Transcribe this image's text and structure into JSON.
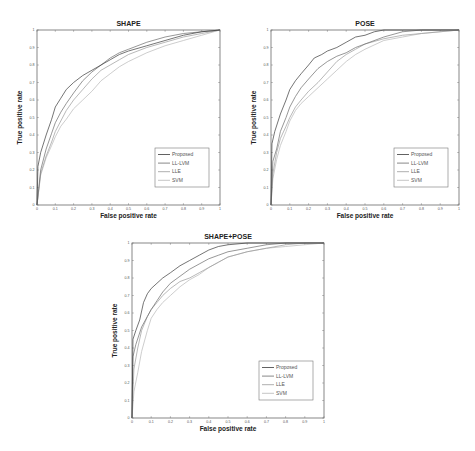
{
  "chart_data": [
    {
      "type": "line",
      "title": "SHAPE",
      "xlabel": "False positive rate",
      "ylabel": "True positive rate",
      "xlim": [
        0,
        1
      ],
      "ylim": [
        0,
        1
      ],
      "xticks": [
        "0",
        "0.1",
        "0.2",
        "0.3",
        "0.4",
        "0.5",
        "0.6",
        "0.7",
        "0.8",
        "0.9",
        "1"
      ],
      "yticks": [
        "0",
        "0.1",
        "0.2",
        "0.3",
        "0.4",
        "0.5",
        "0.6",
        "0.7",
        "0.8",
        "0.9",
        "1"
      ],
      "grid": false,
      "legend_position": "lower right",
      "box": {
        "x": 37,
        "y": 30,
        "w": 183,
        "h": 175
      },
      "series": [
        {
          "name": "Proposed",
          "color": "#3a3a3a",
          "x": [
            0,
            0.005,
            0.02,
            0.05,
            0.08,
            0.1,
            0.13,
            0.16,
            0.2,
            0.25,
            0.3,
            0.35,
            0.4,
            0.45,
            0.5,
            0.6,
            0.7,
            0.8,
            0.9,
            1
          ],
          "y": [
            0,
            0.22,
            0.3,
            0.4,
            0.49,
            0.56,
            0.61,
            0.66,
            0.7,
            0.74,
            0.77,
            0.8,
            0.83,
            0.86,
            0.88,
            0.91,
            0.94,
            0.97,
            0.99,
            1
          ]
        },
        {
          "name": "LL-LVM",
          "color": "#6a6a6a",
          "x": [
            0,
            0.02,
            0.05,
            0.08,
            0.1,
            0.13,
            0.16,
            0.2,
            0.25,
            0.3,
            0.35,
            0.4,
            0.45,
            0.5,
            0.6,
            0.7,
            0.8,
            0.9,
            1
          ],
          "y": [
            0,
            0.2,
            0.32,
            0.41,
            0.47,
            0.53,
            0.58,
            0.64,
            0.71,
            0.76,
            0.8,
            0.84,
            0.87,
            0.89,
            0.93,
            0.96,
            0.98,
            0.99,
            1
          ]
        },
        {
          "name": "LLE",
          "color": "#9a9a9a",
          "x": [
            0,
            0.02,
            0.05,
            0.08,
            0.1,
            0.13,
            0.16,
            0.2,
            0.25,
            0.3,
            0.35,
            0.4,
            0.45,
            0.5,
            0.6,
            0.7,
            0.8,
            0.9,
            1
          ],
          "y": [
            0,
            0.18,
            0.28,
            0.36,
            0.42,
            0.48,
            0.54,
            0.6,
            0.66,
            0.72,
            0.77,
            0.8,
            0.83,
            0.86,
            0.9,
            0.93,
            0.96,
            0.98,
            1
          ]
        },
        {
          "name": "SVM",
          "color": "#b8b8b8",
          "x": [
            0,
            0.02,
            0.05,
            0.08,
            0.1,
            0.13,
            0.16,
            0.2,
            0.25,
            0.3,
            0.35,
            0.4,
            0.45,
            0.5,
            0.6,
            0.7,
            0.8,
            0.9,
            1
          ],
          "y": [
            0,
            0.17,
            0.27,
            0.34,
            0.39,
            0.45,
            0.49,
            0.55,
            0.6,
            0.65,
            0.71,
            0.75,
            0.79,
            0.82,
            0.87,
            0.91,
            0.94,
            0.97,
            1
          ]
        }
      ]
    },
    {
      "type": "line",
      "title": "POSE",
      "xlabel": "False positive rate",
      "ylabel": "True positive rate",
      "xlim": [
        0,
        1
      ],
      "ylim": [
        0,
        1
      ],
      "xticks": [
        "0",
        "0.1",
        "0.2",
        "0.3",
        "0.4",
        "0.5",
        "0.6",
        "0.7",
        "0.8",
        "0.9",
        "1"
      ],
      "yticks": [
        "0",
        "0.1",
        "0.2",
        "0.3",
        "0.4",
        "0.5",
        "0.6",
        "0.7",
        "0.8",
        "0.9",
        "1"
      ],
      "grid": false,
      "legend_position": "lower right",
      "box": {
        "x": 271,
        "y": 30,
        "w": 188,
        "h": 175
      },
      "series": [
        {
          "name": "Proposed",
          "color": "#3a3a3a",
          "x": [
            0,
            0.005,
            0.02,
            0.05,
            0.08,
            0.1,
            0.13,
            0.16,
            0.2,
            0.23,
            0.27,
            0.3,
            0.35,
            0.4,
            0.45,
            0.5,
            0.55,
            0.6,
            0.7,
            0.8,
            1
          ],
          "y": [
            0,
            0.35,
            0.42,
            0.52,
            0.6,
            0.66,
            0.71,
            0.75,
            0.8,
            0.84,
            0.86,
            0.88,
            0.9,
            0.93,
            0.96,
            0.97,
            0.99,
            1,
            1,
            1,
            1
          ]
        },
        {
          "name": "LL-LVM",
          "color": "#6a6a6a",
          "x": [
            0,
            0.01,
            0.03,
            0.05,
            0.08,
            0.1,
            0.13,
            0.16,
            0.2,
            0.25,
            0.3,
            0.35,
            0.4,
            0.45,
            0.5,
            0.6,
            0.7,
            0.8,
            0.9,
            1
          ],
          "y": [
            0,
            0.25,
            0.32,
            0.42,
            0.5,
            0.56,
            0.62,
            0.67,
            0.72,
            0.78,
            0.82,
            0.85,
            0.87,
            0.9,
            0.92,
            0.96,
            0.99,
            1,
            1,
            1
          ]
        },
        {
          "name": "LLE",
          "color": "#9a9a9a",
          "x": [
            0,
            0.01,
            0.03,
            0.05,
            0.08,
            0.1,
            0.13,
            0.16,
            0.2,
            0.25,
            0.3,
            0.35,
            0.4,
            0.45,
            0.5,
            0.6,
            0.7,
            0.8,
            0.9,
            1
          ],
          "y": [
            0,
            0.18,
            0.3,
            0.38,
            0.45,
            0.5,
            0.56,
            0.6,
            0.65,
            0.7,
            0.76,
            0.82,
            0.86,
            0.89,
            0.92,
            0.95,
            0.97,
            0.98,
            0.99,
            1
          ]
        },
        {
          "name": "SVM",
          "color": "#b8b8b8",
          "x": [
            0,
            0.01,
            0.03,
            0.05,
            0.08,
            0.1,
            0.13,
            0.16,
            0.2,
            0.25,
            0.3,
            0.35,
            0.4,
            0.45,
            0.5,
            0.6,
            0.7,
            0.8,
            0.9,
            1
          ],
          "y": [
            0,
            0.15,
            0.26,
            0.34,
            0.42,
            0.48,
            0.54,
            0.58,
            0.62,
            0.67,
            0.72,
            0.77,
            0.82,
            0.86,
            0.89,
            0.94,
            0.96,
            0.98,
            0.99,
            1
          ]
        }
      ]
    },
    {
      "type": "line",
      "title": "SHAPE+POSE",
      "xlabel": "False positive rate",
      "ylabel": "True positive rate",
      "xlim": [
        0,
        1
      ],
      "ylim": [
        0,
        1
      ],
      "xticks": [
        "0",
        "0.1",
        "0.2",
        "0.3",
        "0.4",
        "0.5",
        "0.6",
        "0.7",
        "0.8",
        "0.9",
        "1"
      ],
      "yticks": [
        "0",
        "0.1",
        "0.2",
        "0.3",
        "0.4",
        "0.5",
        "0.6",
        "0.7",
        "0.8",
        "0.9",
        "1"
      ],
      "grid": false,
      "legend_position": "lower right",
      "box": {
        "x": 132,
        "y": 243,
        "w": 192,
        "h": 175
      },
      "series": [
        {
          "name": "Proposed",
          "color": "#3a3a3a",
          "x": [
            0,
            0.005,
            0.02,
            0.04,
            0.06,
            0.08,
            0.1,
            0.13,
            0.16,
            0.2,
            0.25,
            0.3,
            0.35,
            0.4,
            0.45,
            0.5,
            0.6,
            0.7,
            1
          ],
          "y": [
            0,
            0.45,
            0.5,
            0.56,
            0.66,
            0.71,
            0.74,
            0.77,
            0.8,
            0.83,
            0.87,
            0.9,
            0.93,
            0.96,
            0.98,
            0.99,
            1,
            1,
            1
          ]
        },
        {
          "name": "LL-LVM",
          "color": "#6a6a6a",
          "x": [
            0,
            0.005,
            0.02,
            0.05,
            0.08,
            0.1,
            0.13,
            0.16,
            0.2,
            0.25,
            0.3,
            0.35,
            0.4,
            0.45,
            0.5,
            0.6,
            0.7,
            0.8,
            0.9,
            1
          ],
          "y": [
            0,
            0.35,
            0.42,
            0.52,
            0.58,
            0.62,
            0.67,
            0.72,
            0.77,
            0.81,
            0.85,
            0.88,
            0.91,
            0.93,
            0.95,
            0.97,
            0.99,
            1,
            1,
            1
          ]
        },
        {
          "name": "LLE",
          "color": "#9a9a9a",
          "x": [
            0,
            0.01,
            0.03,
            0.05,
            0.08,
            0.1,
            0.13,
            0.16,
            0.2,
            0.25,
            0.3,
            0.35,
            0.4,
            0.45,
            0.5,
            0.6,
            0.7,
            0.8,
            0.9,
            1
          ],
          "y": [
            0,
            0.28,
            0.4,
            0.5,
            0.58,
            0.62,
            0.66,
            0.7,
            0.74,
            0.78,
            0.8,
            0.83,
            0.86,
            0.89,
            0.92,
            0.95,
            0.97,
            0.99,
            1,
            1
          ]
        },
        {
          "name": "SVM",
          "color": "#b8b8b8",
          "x": [
            0,
            0.01,
            0.03,
            0.05,
            0.08,
            0.1,
            0.13,
            0.16,
            0.2,
            0.25,
            0.3,
            0.35,
            0.4,
            0.45,
            0.5,
            0.6,
            0.7,
            0.8,
            0.9,
            1
          ],
          "y": [
            0,
            0.15,
            0.26,
            0.38,
            0.5,
            0.57,
            0.62,
            0.66,
            0.7,
            0.75,
            0.79,
            0.82,
            0.86,
            0.89,
            0.92,
            0.95,
            0.97,
            0.98,
            0.99,
            1
          ]
        }
      ]
    }
  ]
}
